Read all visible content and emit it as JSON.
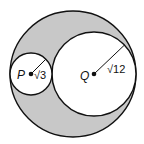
{
  "diagram": {
    "type": "circles-geometry",
    "colors": {
      "shaded": "#c8c8c8",
      "stroke": "#111111",
      "background": "#ffffff"
    },
    "outer_circle": {
      "cx": 73,
      "cy": 74,
      "r": 63
    },
    "circle_p": {
      "label": "P",
      "radius_label": "√3",
      "cx": 31,
      "cy": 74,
      "r": 21
    },
    "circle_q": {
      "label": "Q",
      "radius_label": "√12",
      "cx": 94,
      "cy": 74,
      "r": 42
    }
  }
}
